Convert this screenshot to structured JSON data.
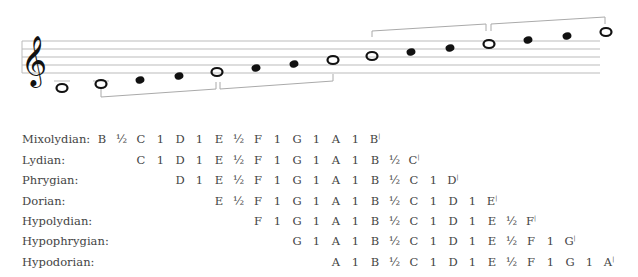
{
  "staff": {
    "clef": "treble-clef",
    "notes": [
      {
        "pitch": "A",
        "type": "whole",
        "x": 62,
        "y": 88,
        "ledger": true
      },
      {
        "pitch": "B",
        "type": "whole",
        "x": 101,
        "y": 84,
        "ledger": true
      },
      {
        "pitch": "C",
        "type": "filled",
        "x": 140,
        "y": 80
      },
      {
        "pitch": "D",
        "type": "filled",
        "x": 179,
        "y": 76
      },
      {
        "pitch": "E",
        "type": "whole",
        "x": 217,
        "y": 72
      },
      {
        "pitch": "F",
        "type": "filled",
        "x": 256,
        "y": 68
      },
      {
        "pitch": "G",
        "type": "filled",
        "x": 294,
        "y": 64
      },
      {
        "pitch": "A",
        "type": "whole",
        "x": 333,
        "y": 60
      },
      {
        "pitch": "B",
        "type": "whole",
        "x": 372,
        "y": 56
      },
      {
        "pitch": "C",
        "type": "filled",
        "x": 411,
        "y": 52
      },
      {
        "pitch": "D",
        "type": "filled",
        "x": 450,
        "y": 48
      },
      {
        "pitch": "E",
        "type": "whole",
        "x": 489,
        "y": 44
      },
      {
        "pitch": "F",
        "type": "filled",
        "x": 528,
        "y": 40
      },
      {
        "pitch": "G",
        "type": "filled",
        "x": 567,
        "y": 36
      },
      {
        "pitch": "A",
        "type": "whole",
        "x": 606,
        "y": 32
      }
    ]
  },
  "modes": [
    {
      "name": "Mixolydian:",
      "start": 0,
      "items": [
        "B",
        "½",
        "C",
        "1",
        "D",
        "1",
        "E",
        "½",
        "F",
        "1",
        "G",
        "1",
        "A",
        "1",
        "B'"
      ]
    },
    {
      "name": "Lydian:",
      "start": 2,
      "items": [
        "C",
        "1",
        "D",
        "1",
        "E",
        "½",
        "F",
        "1",
        "G",
        "1",
        "A",
        "1",
        "B",
        "½",
        "C'"
      ]
    },
    {
      "name": "Phrygian:",
      "start": 4,
      "items": [
        "D",
        "1",
        "E",
        "½",
        "F",
        "1",
        "G",
        "1",
        "A",
        "1",
        "B",
        "½",
        "C",
        "1",
        "D'"
      ]
    },
    {
      "name": "Dorian:",
      "start": 6,
      "items": [
        "E",
        "½",
        "F",
        "1",
        "G",
        "1",
        "A",
        "1",
        "B",
        "½",
        "C",
        "1",
        "D",
        "1",
        "E'"
      ]
    },
    {
      "name": "Hypolydian:",
      "start": 8,
      "items": [
        "F",
        "1",
        "G",
        "1",
        "A",
        "1",
        "B",
        "½",
        "C",
        "1",
        "D",
        "1",
        "E",
        "½",
        "F'"
      ]
    },
    {
      "name": "Hypophrygian:",
      "start": 10,
      "items": [
        "G",
        "1",
        "A",
        "1",
        "B",
        "½",
        "C",
        "1",
        "D",
        "1",
        "E",
        "½",
        "F",
        "1",
        "G'"
      ]
    },
    {
      "name": "Hypodorian:",
      "start": 12,
      "items": [
        "A",
        "1",
        "B",
        "½",
        "C",
        "1",
        "D",
        "1",
        "E",
        "½",
        "F",
        "1",
        "G",
        "1",
        "A'"
      ]
    }
  ]
}
